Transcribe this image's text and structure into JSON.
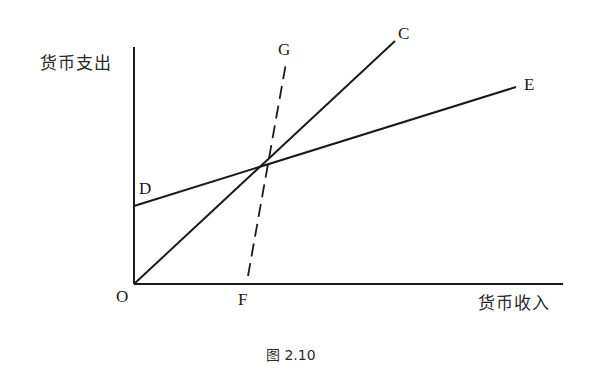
{
  "figure": {
    "caption": "图 2.10",
    "y_axis_label": "货币支出",
    "x_axis_label": "货币收入",
    "points": {
      "origin": "O",
      "d": "D",
      "e": "E",
      "c": "C",
      "g": "G",
      "f": "F"
    },
    "lines": [
      {
        "name": "OC",
        "from": "O",
        "to": "C",
        "style": "solid"
      },
      {
        "name": "DE",
        "from": "D",
        "to": "E",
        "style": "solid"
      },
      {
        "name": "FG",
        "from": "F",
        "to": "G",
        "style": "dashed"
      }
    ],
    "stroke_color": "#1a1a1a",
    "background": "#ffffff"
  }
}
